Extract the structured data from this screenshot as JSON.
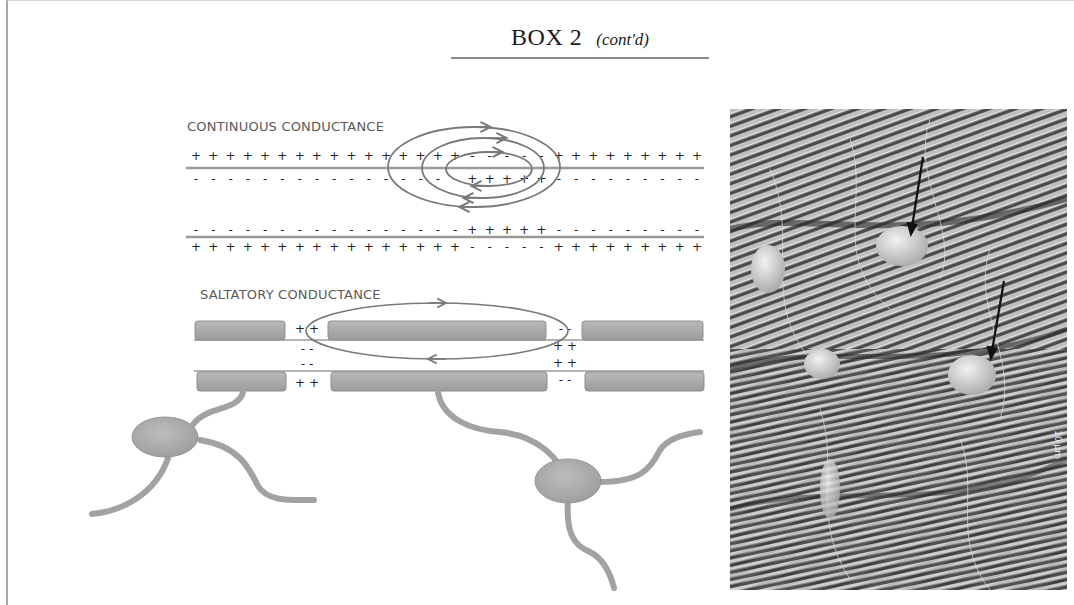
{
  "header": {
    "title": "BOX 2",
    "subtitle": "(cont'd)"
  },
  "continuous": {
    "label": "CONTINUOUS CONDUCTANCE",
    "membrane_a": {
      "outside": "+ + + + + + + + + + + + + + + + - - - - - + + + + + + + + +",
      "inside": "- - - - - - - - - - - - - - - - + + + + + - - - - - - - - -"
    },
    "membrane_b": {
      "inside": "- - - - - - - - - - - - - - - - + + + + + - - - - - - - - -",
      "outside": "+ + + + + + + + + + + + + + + + - - - - - + + + + + + + + +"
    },
    "current_loops": 3
  },
  "saltatory": {
    "label": "SALTATORY CONDUCTANCE",
    "node1": {
      "top_out": "+ +",
      "top_in": "- -",
      "bottom_in": "- -",
      "bottom_out": "+ +"
    },
    "node2": {
      "top_out": "- -",
      "top_in": "+ +",
      "bottom_in": "+ +",
      "bottom_out": "- -"
    },
    "myelin_segments": 3,
    "oligodendrocytes": 2
  },
  "micrograph": {
    "description": "Scanning electron micrograph of myelinated axon bundles with oligodendrocytes (arrows)",
    "scale_bar": "10 µm",
    "arrows": 2
  },
  "colors": {
    "line": "#8c8c8c",
    "myelin": "#a9a9a9",
    "myelin_edge": "#8f8f8f",
    "text": "#5a5a5a",
    "rule": "#8a8a8a"
  }
}
